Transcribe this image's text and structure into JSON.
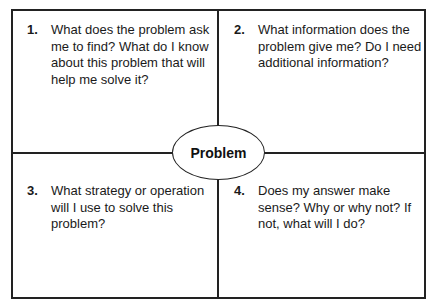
{
  "center": {
    "label": "Problem"
  },
  "quadrants": [
    {
      "number": "1.",
      "text": "What does the problem ask me to find? What do I know about this problem that will help me solve it?"
    },
    {
      "number": "2.",
      "text": "What information does the problem give me?  Do I need additional information?"
    },
    {
      "number": "3.",
      "text": "What strategy or operation will I use to solve this problem?"
    },
    {
      "number": "4.",
      "text": "Does my answer make sense?  Why or why not?  If not, what will I do?"
    }
  ]
}
